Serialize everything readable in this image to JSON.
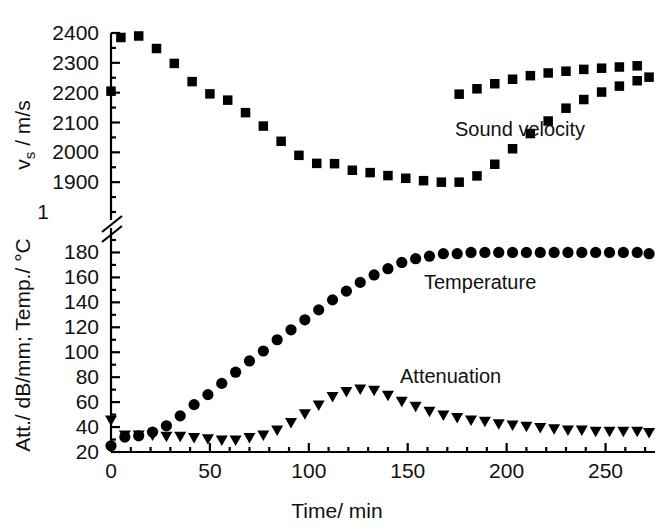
{
  "chart_data": {
    "type": "scatter",
    "title": "",
    "xlabel": "Time/ min",
    "ylabel_top": "vs / m/s",
    "ylabel_bottom": "Att./ dB/mm; Temp./ °C",
    "grid": false,
    "legend_position": "inline-annotations",
    "broken_axis": true,
    "axis_break_note": "y-axis is broken between the upper sound-velocity scale and the lower attenuation/temperature scale",
    "xlim": [
      0,
      275
    ],
    "xticks": [
      0,
      50,
      100,
      150,
      200,
      250
    ],
    "xtick_labels": [
      "0",
      "50",
      "100",
      "150",
      "200",
      "250"
    ],
    "xminor_step": 10,
    "ylim_top": [
      1800,
      2400
    ],
    "yticks_top": [
      1900,
      2000,
      2100,
      2200,
      2300,
      2400
    ],
    "ytick_labels_top": [
      "1900",
      "2000",
      "2100",
      "2200",
      "2300",
      "2400"
    ],
    "ytick_clipped_top": "1800",
    "ytick_clipped_display": "1",
    "yminor_step_top": 50,
    "ylim_bottom": [
      20,
      190
    ],
    "yticks_bottom": [
      20,
      40,
      60,
      80,
      100,
      120,
      140,
      160,
      180
    ],
    "ytick_labels_bottom": [
      "20",
      "40",
      "60",
      "80",
      "100",
      "120",
      "140",
      "160",
      "180"
    ],
    "yminor_step_bottom": 10,
    "series": [
      {
        "name": "Sound velocity",
        "marker": "square",
        "color": "#000000",
        "axis": "top",
        "unit": "m/s",
        "annotation": "Sound velocity",
        "x": [
          0,
          5,
          14,
          23,
          32,
          41,
          50,
          59,
          68,
          77,
          86,
          95,
          104,
          113,
          122,
          131,
          140,
          149,
          158,
          167,
          176,
          185,
          194,
          203,
          212,
          221,
          230,
          239,
          248,
          257,
          266,
          272
        ],
        "y": [
          2205,
          2385,
          2390,
          2348,
          2298,
          2237,
          2196,
          2175,
          2133,
          2088,
          2037,
          1990,
          1963,
          1962,
          1940,
          1932,
          1922,
          1913,
          1905,
          1900,
          1900,
          1921,
          1960,
          2012,
          2063,
          2105,
          2148,
          2177,
          2202,
          2222,
          2240,
          2252
        ]
      },
      {
        "name": "Sound velocity (tail)",
        "marker": "square",
        "color": "#000000",
        "axis": "top",
        "unit": "m/s",
        "x": [
          176,
          185,
          194,
          203,
          212,
          221,
          230,
          239,
          248,
          257,
          266
        ],
        "y": [
          2195,
          2213,
          2230,
          2245,
          2257,
          2266,
          2272,
          2278,
          2282,
          2286,
          2290
        ]
      },
      {
        "name": "Temperature",
        "marker": "circle",
        "color": "#000000",
        "axis": "bottom",
        "unit": "°C",
        "annotation": "Temperature",
        "x": [
          0,
          7,
          14,
          21,
          28,
          35,
          42,
          49,
          56,
          63,
          70,
          77,
          84,
          91,
          98,
          105,
          112,
          119,
          126,
          133,
          140,
          147,
          154,
          161,
          168,
          175,
          182,
          189,
          196,
          203,
          210,
          217,
          224,
          231,
          238,
          245,
          252,
          259,
          266,
          272
        ],
        "y": [
          25,
          32,
          33,
          36,
          41,
          49,
          58,
          66,
          75,
          84,
          93,
          101,
          110,
          118,
          126,
          134,
          142,
          149,
          156,
          162,
          167,
          172,
          175,
          177,
          179,
          179,
          180,
          180,
          180,
          180,
          180,
          180,
          180,
          180,
          180,
          180,
          180,
          180,
          180,
          179
        ]
      },
      {
        "name": "Attenuation",
        "marker": "triangle-down",
        "color": "#000000",
        "axis": "bottom",
        "unit": "dB/mm",
        "annotation": "Attenuation",
        "x": [
          0,
          7,
          14,
          21,
          28,
          35,
          42,
          49,
          56,
          63,
          70,
          77,
          84,
          91,
          98,
          105,
          112,
          119,
          126,
          133,
          140,
          147,
          154,
          161,
          168,
          175,
          182,
          189,
          196,
          203,
          210,
          217,
          224,
          231,
          238,
          245,
          252,
          259,
          266,
          272
        ],
        "y": [
          45,
          33,
          33,
          33,
          32,
          32,
          31,
          30,
          29,
          29,
          31,
          33,
          37,
          43,
          50,
          57,
          64,
          68,
          70,
          69,
          65,
          60,
          56,
          52,
          49,
          47,
          45,
          44,
          42,
          41,
          40,
          39,
          38,
          37,
          37,
          36,
          36,
          36,
          36,
          35
        ]
      }
    ]
  },
  "annotations": {
    "sound_velocity": "Sound velocity",
    "temperature": "Temperature",
    "attenuation": "Attenuation"
  },
  "axes": {
    "x_title": "Time/ min",
    "y_title_top_main": "v",
    "y_title_top_sub": "s",
    "y_title_top_rest": " / m/s",
    "y_title_bottom": "Att./ dB/mm; Temp./ °C"
  }
}
